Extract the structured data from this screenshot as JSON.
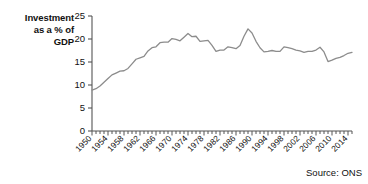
{
  "axis_label": "Investment\nas a % of\nGDP",
  "source": "Source: ONS",
  "chart_data": {
    "type": "line",
    "title": "",
    "subtitle": "",
    "xlabel": "",
    "ylabel": "Investment as a % of GDP",
    "ylim": [
      0,
      25
    ],
    "yticks": [
      0,
      5,
      10,
      15,
      20,
      25
    ],
    "xlim": [
      1950,
      2015
    ],
    "xticks": [
      1950,
      1954,
      1958,
      1962,
      1966,
      1970,
      1974,
      1978,
      1982,
      1986,
      1990,
      1994,
      1998,
      2002,
      2006,
      2010,
      2014
    ],
    "xtick_labels": [
      "1950",
      "1954",
      "1958",
      "1962",
      "1966",
      "1970",
      "1974",
      "1978",
      "1982",
      "1986",
      "1990",
      "1994",
      "1998",
      "2002",
      "2006",
      "2010",
      "2014"
    ],
    "minor_xticks_every": 1,
    "grid": false,
    "legend": "none",
    "line_color": "#8c8c8c",
    "line_width": 1.3,
    "series": [
      {
        "name": "Investment as a % of GDP",
        "x": [
          1950,
          1951,
          1952,
          1953,
          1954,
          1955,
          1956,
          1957,
          1958,
          1959,
          1960,
          1961,
          1962,
          1963,
          1964,
          1965,
          1966,
          1967,
          1968,
          1969,
          1970,
          1971,
          1972,
          1973,
          1974,
          1975,
          1976,
          1977,
          1978,
          1979,
          1980,
          1981,
          1982,
          1983,
          1984,
          1985,
          1986,
          1987,
          1988,
          1989,
          1990,
          1991,
          1992,
          1993,
          1994,
          1995,
          1996,
          1997,
          1998,
          1999,
          2000,
          2001,
          2002,
          2003,
          2004,
          2005,
          2006,
          2007,
          2008,
          2009,
          2010,
          2011,
          2012,
          2013,
          2014,
          2015
        ],
        "values": [
          8.9,
          9.2,
          9.8,
          10.6,
          11.4,
          12.2,
          12.6,
          13.0,
          13.1,
          13.6,
          14.6,
          15.6,
          15.9,
          16.2,
          17.4,
          18.1,
          18.3,
          19.2,
          19.3,
          19.3,
          20.1,
          19.9,
          19.6,
          20.4,
          21.2,
          20.5,
          20.6,
          19.5,
          19.6,
          19.7,
          18.6,
          17.3,
          17.6,
          17.6,
          18.3,
          18.1,
          17.9,
          18.6,
          20.6,
          22.2,
          21.3,
          19.5,
          18.1,
          17.2,
          17.3,
          17.5,
          17.3,
          17.3,
          18.3,
          18.1,
          17.9,
          17.6,
          17.4,
          17.1,
          17.3,
          17.3,
          17.6,
          18.2,
          17.2,
          15.1,
          15.4,
          15.8,
          16.0,
          16.4,
          16.9,
          17.1
        ]
      }
    ]
  }
}
